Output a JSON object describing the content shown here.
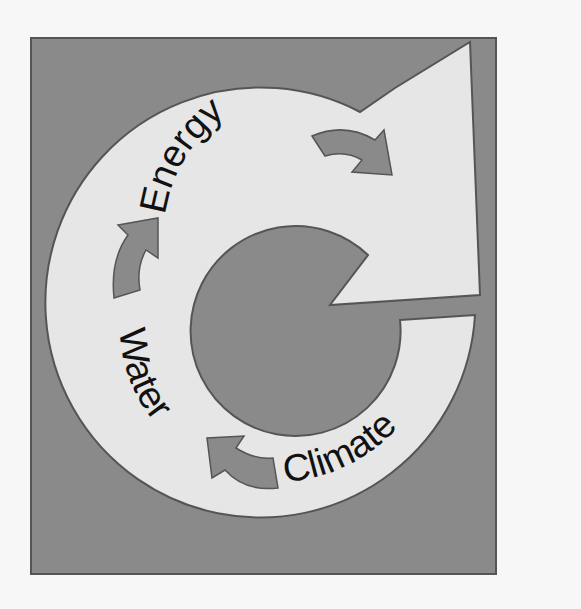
{
  "diagram": {
    "type": "cycle",
    "labels": {
      "energy": "Energy",
      "water": "Water",
      "climate": "Climate"
    },
    "colors": {
      "page_background": "#f7f7f7",
      "box_fill": "#8a8a8a",
      "ring_fill": "#e6e6e6",
      "small_arrow_fill": "#8a8a8a",
      "outline": "#555555",
      "text": "#111111"
    }
  }
}
